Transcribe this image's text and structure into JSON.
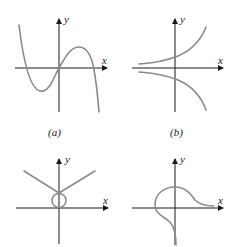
{
  "figure": {
    "panels": [
      {
        "id": "a",
        "caption": "(a)",
        "x_label": "x",
        "y_label": "y",
        "description": "cubic-like curve: rises from upper left, local min left of origin, through origin, local max right, falls to lower right"
      },
      {
        "id": "b",
        "caption": "(b)",
        "x_label": "x",
        "y_label": "y",
        "description": "two curves symmetric about x-axis: upper curve increasing exponentially, lower curve decreasing mirror image"
      },
      {
        "id": "c",
        "caption": "",
        "x_label": "x",
        "y_label": "y",
        "description": "V-shaped pair of lines meeting on y-axis above a small circle tangent to origin"
      },
      {
        "id": "d",
        "caption": "",
        "x_label": "x",
        "y_label": "y",
        "description": "curve from bottom along y-axis loops left and over top, then decays toward positive x-axis"
      }
    ],
    "colors": {
      "axis": "#1a1a1a",
      "curve": "#8a8a8a",
      "background": "#ffffff"
    }
  }
}
